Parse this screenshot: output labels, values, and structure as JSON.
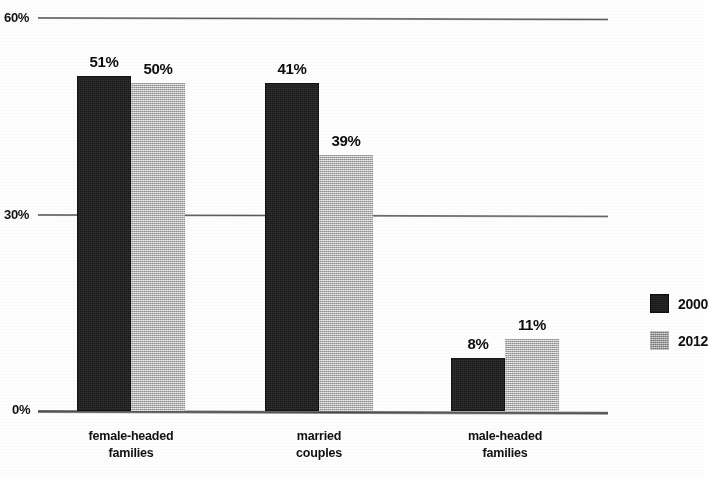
{
  "chart_data": {
    "type": "bar",
    "title": "",
    "xlabel": "",
    "ylabel": "",
    "categories": [
      "female-headed\nfamilies",
      "married\ncouples",
      "male-headed\nfamilies"
    ],
    "series": [
      {
        "name": "2000",
        "color": "#1b1b1b",
        "values": [
          51,
          50,
          8
        ]
      },
      {
        "name": "2012",
        "color": "#b3b3b3",
        "values": [
          50,
          39,
          11
        ]
      }
    ],
    "value_labels": [
      [
        "51%",
        "41%",
        "8%"
      ],
      [
        "50%",
        "39%",
        "11%"
      ]
    ],
    "ylim": [
      0,
      60
    ],
    "yticks": [
      0,
      30,
      60
    ],
    "ytick_labels": [
      "0%",
      "30%",
      "60%"
    ],
    "grid": true,
    "legend_position": "right"
  },
  "axis": {
    "tick_60": "60%",
    "tick_30": "30%",
    "tick_0": "0%"
  },
  "groups": [
    {
      "label": "female-headed\nfamilies",
      "bars": [
        {
          "series": "2000",
          "value_label": "51%"
        },
        {
          "series": "2012",
          "value_label": "50%"
        }
      ]
    },
    {
      "label": "married\ncouples",
      "bars": [
        {
          "series": "2000",
          "value_label": "41%"
        },
        {
          "series": "2012",
          "value_label": "39%"
        }
      ]
    },
    {
      "label": "male-headed\nfamilies",
      "bars": [
        {
          "series": "2000",
          "value_label": "8%"
        },
        {
          "series": "2012",
          "value_label": "11%"
        }
      ]
    }
  ],
  "legend": {
    "items": [
      {
        "label": "2000",
        "swatch": "dark-swatch-icon"
      },
      {
        "label": "2012",
        "swatch": "light-swatch-icon"
      }
    ]
  }
}
